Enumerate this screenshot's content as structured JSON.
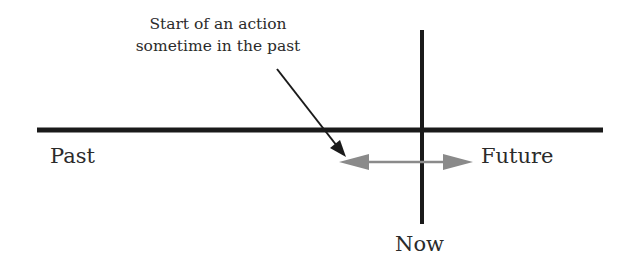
{
  "diagram": {
    "annotation": {
      "line1": "Start of an action",
      "line2": "sometime in the past"
    },
    "labels": {
      "past": "Past",
      "future": "Future",
      "now": "Now"
    },
    "colors": {
      "timeline": "#1a1a1a",
      "now_line": "#1a1a1a",
      "pointer_arrow": "#1a1a1a",
      "duration_arrow": "#8a8a8a",
      "text": "#2b2b2b",
      "background": "#ffffff"
    }
  }
}
